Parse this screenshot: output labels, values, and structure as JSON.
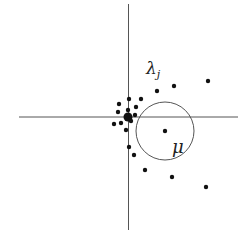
{
  "diagram": {
    "width": 251,
    "height": 233,
    "colors": {
      "background": "#ffffff",
      "axis": "#555555",
      "point": "#111111",
      "circle": "#555555",
      "label": "#222222"
    },
    "axes": {
      "horizontal": {
        "x1": 19,
        "x2": 238,
        "y": 117
      },
      "vertical": {
        "x": 128.5,
        "y1": 4,
        "y2": 230
      }
    },
    "circle": {
      "cx": 165,
      "cy": 131,
      "r": 29
    },
    "origin_point": {
      "x": 128,
      "y": 117,
      "r": 4.5
    },
    "points": [
      {
        "x": 129,
        "y": 99
      },
      {
        "x": 141,
        "y": 99
      },
      {
        "x": 119,
        "y": 104
      },
      {
        "x": 136,
        "y": 107
      },
      {
        "x": 128,
        "y": 110
      },
      {
        "x": 118,
        "y": 112
      },
      {
        "x": 135,
        "y": 115
      },
      {
        "x": 114,
        "y": 124
      },
      {
        "x": 121,
        "y": 123
      },
      {
        "x": 131,
        "y": 121
      },
      {
        "x": 126,
        "y": 130
      },
      {
        "x": 129,
        "y": 147
      },
      {
        "x": 134,
        "y": 155
      },
      {
        "x": 157,
        "y": 91
      },
      {
        "x": 174,
        "y": 86
      },
      {
        "x": 208,
        "y": 81
      },
      {
        "x": 165,
        "y": 131
      },
      {
        "x": 145,
        "y": 170
      },
      {
        "x": 172,
        "y": 177
      },
      {
        "x": 206,
        "y": 187
      }
    ],
    "point_radius": 2.2,
    "labels": {
      "lambda": {
        "text": "λ",
        "subscript": "j",
        "x": 146,
        "y": 58
      },
      "mu": {
        "text": "μ",
        "x": 172,
        "y": 136
      }
    }
  }
}
